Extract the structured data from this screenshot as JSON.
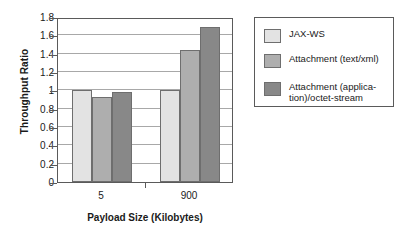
{
  "chart_data": {
    "type": "bar",
    "title": "",
    "xlabel": "Payload Size (Kilobytes)",
    "ylabel": "Throughput Ratio",
    "categories": [
      "5",
      "900"
    ],
    "ylim": [
      0,
      1.8
    ],
    "yticks": [
      "0",
      "0.2",
      "0.4",
      "0.6",
      "0.8",
      "1",
      "1.2",
      "1.4",
      "1.6",
      "1.8"
    ],
    "ytick_values": [
      0,
      0.2,
      0.4,
      0.6,
      0.8,
      1,
      1.2,
      1.4,
      1.6,
      1.8
    ],
    "grid": "horizontal",
    "legend_position": "right",
    "series": [
      {
        "name": "JAX-WS",
        "color": "#e3e3e3",
        "values": [
          1.0,
          1.0
        ]
      },
      {
        "name": "Attachment (text/xml)",
        "color": "#aeaeae",
        "values": [
          0.93,
          1.44
        ]
      },
      {
        "name": "Attachment (applica-\ntion)/octet-stream",
        "color": "#888888",
        "values": [
          0.98,
          1.69
        ]
      }
    ]
  },
  "colors": {
    "series_1": "#e3e3e3",
    "series_2": "#aeaeae",
    "series_3": "#888888",
    "axis": "#5a5a5a",
    "grid": "#a8a8a8",
    "bar_border": "#6e6e6e",
    "background": "#ffffff"
  }
}
